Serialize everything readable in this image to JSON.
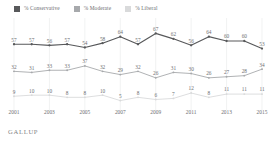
{
  "legend": {
    "items": [
      {
        "label": "% Conservative",
        "color": "#58595b",
        "key": "conservative"
      },
      {
        "label": "% Moderate",
        "color": "#a7a9ac",
        "key": "moderate"
      },
      {
        "label": "% Liberal",
        "color": "#d9dadb",
        "key": "liberal"
      }
    ]
  },
  "source": {
    "text": "GALLUP"
  },
  "chart_data": {
    "type": "line",
    "title": "",
    "subtitle": "",
    "xlabel": "",
    "ylabel": "",
    "ylim": [
      0,
      72
    ],
    "grid": true,
    "legend_position": "top-left",
    "x": [
      2001,
      2002,
      2003,
      2004,
      2005,
      2006,
      2007,
      2008,
      2009,
      2010,
      2011,
      2012,
      2013,
      2014,
      2015
    ],
    "tick_labels": [
      "2001",
      "2003",
      "2005",
      "2007",
      "2009",
      "2011",
      "2013",
      "2015"
    ],
    "tick_values": [
      2001,
      2003,
      2005,
      2007,
      2009,
      2011,
      2013,
      2015
    ],
    "series": [
      {
        "name": "% Conservative",
        "color": "#58595b",
        "values": [
          57,
          57,
          56,
          57,
          54,
          58,
          64,
          57,
          67,
          62,
          56,
          64,
          60,
          60,
          53
        ]
      },
      {
        "name": "% Moderate",
        "color": "#a7a9ac",
        "values": [
          32,
          31,
          33,
          33,
          37,
          32,
          29,
          32,
          26,
          31,
          30,
          26,
          27,
          28,
          34
        ]
      },
      {
        "name": "% Liberal",
        "color": "#d9dadb",
        "values": [
          9,
          10,
          10,
          8,
          8,
          10,
          5,
          8,
          6,
          7,
          12,
          8,
          11,
          11,
          11
        ]
      }
    ]
  }
}
